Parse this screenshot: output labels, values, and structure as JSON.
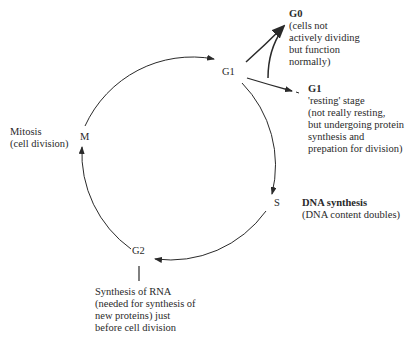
{
  "diagram": {
    "nodes": {
      "g1": "G1",
      "s": "S",
      "g2": "G2",
      "m": "M"
    },
    "annotations": {
      "g0": {
        "title": "G0",
        "lines": [
          "(cells not",
          "actively dividing",
          "but function",
          "normally)"
        ]
      },
      "g1_resting": {
        "title": "G1",
        "lines": [
          "'resting' stage",
          "(not really resting,",
          "but undergoing protein",
          "synthesis and",
          "prepation for division)"
        ]
      },
      "s": {
        "title": "DNA synthesis",
        "lines": [
          "(DNA content doubles)"
        ]
      },
      "g2": {
        "lines": [
          "Synthesis of RNA",
          "(needed for synthesis of",
          "new proteins) just",
          "before cell division"
        ]
      },
      "m": {
        "lines": [
          "Mitosis",
          "(cell division)"
        ]
      }
    },
    "colors": {
      "line": "#2a2a2a",
      "text": "#2a2a2a",
      "background": "#ffffff"
    }
  }
}
